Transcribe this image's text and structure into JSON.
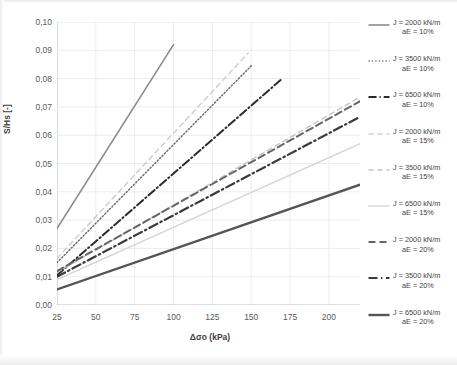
{
  "chart_data": {
    "type": "line",
    "title": "",
    "xlabel": "Δσo (kPa)",
    "ylabel": "S/Hs [-]",
    "xlim": [
      25,
      220
    ],
    "ylim": [
      0.0,
      0.1
    ],
    "xticks": [
      25,
      50,
      75,
      100,
      125,
      150,
      175,
      200
    ],
    "xtick_labels": [
      "25",
      "50",
      "75",
      "100",
      "125",
      "150",
      "175",
      "200"
    ],
    "yticks": [
      0.0,
      0.01,
      0.02,
      0.03,
      0.04,
      0.05,
      0.06,
      0.07,
      0.08,
      0.09,
      0.1
    ],
    "ytick_labels": [
      "0,00",
      "0,01",
      "0,02",
      "0,03",
      "0,04",
      "0,05",
      "0,06",
      "0,07",
      "0,08",
      "0,09",
      "0,10"
    ],
    "grid": true,
    "legend_position": "right",
    "series": [
      {
        "name": "J = 2000 kN/m aE = 10%",
        "J": "2000",
        "aE": "10%",
        "style": "solid",
        "color": "#8c8c8c",
        "width": 1.6,
        "x": [
          25,
          100
        ],
        "y": [
          0.027,
          0.092
        ]
      },
      {
        "name": "J = 3500 kN/m aE = 10%",
        "J": "3500",
        "aE": "10%",
        "style": "dotted",
        "color": "#6e6e6e",
        "width": 1.5,
        "x": [
          25,
          150
        ],
        "y": [
          0.015,
          0.0845
        ]
      },
      {
        "name": "J = 6500 kN/m aE = 10%",
        "J": "6500",
        "aE": "10%",
        "style": "dashdot",
        "color": "#2b2b2b",
        "width": 2.0,
        "x": [
          25,
          170
        ],
        "y": [
          0.0105,
          0.08
        ]
      },
      {
        "name": "J = 2000 kN/m aE = 15%",
        "J": "2000",
        "aE": "15%",
        "style": "dashed-light",
        "color": "#cfcfcf",
        "width": 1.5,
        "x": [
          25,
          148
        ],
        "y": [
          0.0165,
          0.089
        ]
      },
      {
        "name": "J = 3500 kN/m aE = 15%",
        "J": "3500",
        "aE": "15%",
        "style": "dashed-light",
        "color": "#c4c4c4",
        "width": 1.4,
        "x": [
          25,
          220
        ],
        "y": [
          0.0115,
          0.0735
        ]
      },
      {
        "name": "J = 6500 kN/m aE = 15%",
        "J": "6500",
        "aE": "15%",
        "style": "solid-light",
        "color": "#d6d6d6",
        "width": 1.4,
        "x": [
          25,
          220
        ],
        "y": [
          0.009,
          0.057
        ]
      },
      {
        "name": "J = 2000 kN/m aE = 20%",
        "J": "2000",
        "aE": "20%",
        "style": "dashed-heavy",
        "color": "#666666",
        "width": 2.0,
        "x": [
          25,
          220
        ],
        "y": [
          0.012,
          0.072
        ]
      },
      {
        "name": "J = 3500 kN/m aE = 20%",
        "J": "3500",
        "aE": "20%",
        "style": "dashdot-heavy",
        "color": "#3a3a3a",
        "width": 2.2,
        "x": [
          25,
          220
        ],
        "y": [
          0.01,
          0.0665
        ]
      },
      {
        "name": "J = 6500 kN/m aE = 20%",
        "J": "6500",
        "aE": "20%",
        "style": "solid-heavy",
        "color": "#555555",
        "width": 2.4,
        "x": [
          25,
          220
        ],
        "y": [
          0.0055,
          0.0425
        ]
      }
    ]
  },
  "axes": {
    "x_title": "Δσo (kPa)",
    "y_title": "S/Hs [-]",
    "x_tick_labels": [
      "25",
      "50",
      "75",
      "100",
      "125",
      "150",
      "175",
      "200"
    ],
    "y_tick_labels": [
      "0,00",
      "0,01",
      "0,02",
      "0,03",
      "0,04",
      "0,05",
      "0,06",
      "0,07",
      "0,08",
      "0,09",
      "0,10"
    ]
  },
  "legend": {
    "items": [
      {
        "line1": "J = 2000 kN/m",
        "line2": "aE = 10%"
      },
      {
        "line1": "J = 3500 kN/m",
        "line2": "aE = 10%"
      },
      {
        "line1": "J = 6500 kN/m",
        "line2": "aE = 10%"
      },
      {
        "line1": "J = 2000 kN/m",
        "line2": "aE = 15%"
      },
      {
        "line1": "J = 3500 kN/m",
        "line2": "aE = 15%"
      },
      {
        "line1": "J = 6500 kN/m",
        "line2": "aE = 15%"
      },
      {
        "line1": "J = 2000 kN/m",
        "line2": "aE = 20%"
      },
      {
        "line1": "J = 3500 kN/m",
        "line2": "aE = 20%"
      },
      {
        "line1": "J = 6500 kN/m",
        "line2": "aE = 20%"
      }
    ]
  },
  "colors": {
    "grid": "#e4ecf2",
    "axis": "#bfbfbf",
    "tick_text": "#5a5a5a",
    "title_text": "#3f3f3f"
  }
}
